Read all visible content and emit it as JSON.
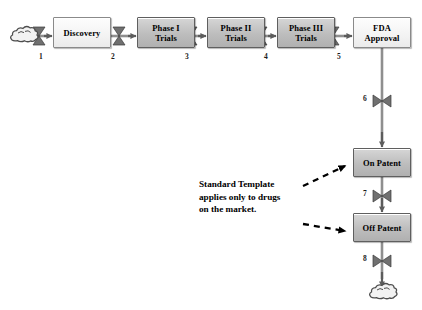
{
  "diagram": {
    "colors": {
      "stroke": "#6e6e6e",
      "line": "#6f6f6f",
      "shaded_fill": "#c2c2c2",
      "light_fill": "#f5f5f5",
      "text": "#000000"
    },
    "stocks": [
      {
        "id": "discovery",
        "label": "Discovery",
        "style": "light",
        "x": 53,
        "y": 17,
        "w": 58,
        "h": 31
      },
      {
        "id": "phase1",
        "label": "Phase I\nTrials",
        "style": "shaded",
        "x": 137,
        "y": 17,
        "w": 58,
        "h": 31
      },
      {
        "id": "phase2",
        "label": "Phase II\nTrials",
        "style": "shaded",
        "x": 207,
        "y": 17,
        "w": 58,
        "h": 31
      },
      {
        "id": "phase3",
        "label": "Phase III\nTrials",
        "style": "shaded",
        "x": 277,
        "y": 17,
        "w": 58,
        "h": 31
      },
      {
        "id": "fda",
        "label": "FDA\nApproval",
        "style": "light",
        "x": 353,
        "y": 17,
        "w": 58,
        "h": 31
      },
      {
        "id": "on-patent",
        "label": "On Patent",
        "style": "shaded",
        "x": 353,
        "y": 148,
        "w": 58,
        "h": 29
      },
      {
        "id": "off-patent",
        "label": "Off Patent",
        "style": "shaded",
        "x": 353,
        "y": 213,
        "w": 58,
        "h": 29
      }
    ],
    "flow_labels": [
      {
        "id": "flow-1",
        "label": "1",
        "x": 39,
        "y": 52
      },
      {
        "id": "flow-2",
        "label": "2",
        "x": 111,
        "y": 52
      },
      {
        "id": "flow-3",
        "label": "3",
        "x": 185,
        "y": 52
      },
      {
        "id": "flow-4",
        "label": "4",
        "x": 264,
        "y": 52
      },
      {
        "id": "flow-5",
        "label": "5",
        "x": 337,
        "y": 52
      },
      {
        "id": "flow-6",
        "label": "6",
        "x": 363,
        "y": 94
      },
      {
        "id": "flow-7",
        "label": "7",
        "x": 363,
        "y": 189
      },
      {
        "id": "flow-8",
        "label": "8",
        "x": 363,
        "y": 254
      }
    ],
    "annotation": {
      "id": "standard-template-note",
      "text": "Standard Template\napplies only to drugs\non the market.",
      "x": 199,
      "y": 178
    },
    "sources": [
      {
        "id": "source-cloud",
        "x": 22,
        "y": 36
      }
    ],
    "sinks": [
      {
        "id": "sink-cloud",
        "x": 381,
        "y": 292
      }
    ]
  }
}
